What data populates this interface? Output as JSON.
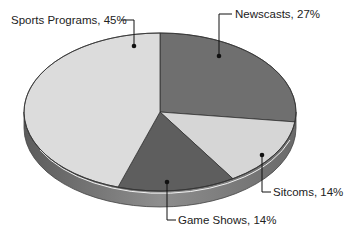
{
  "chart_data": {
    "type": "pie",
    "style": "3d-tilted",
    "title": "",
    "categories": [
      "Newscasts",
      "Sitcoms",
      "Game Shows",
      "Sports Programs"
    ],
    "values": [
      27,
      14,
      14,
      45
    ],
    "unit": "%",
    "start_angle_deg": 0,
    "direction": "clockwise",
    "legend": "none (leader-line labels)",
    "labels": [
      {
        "category": "Newscasts",
        "text": "Newscasts, 27%"
      },
      {
        "category": "Sitcoms",
        "text": "Sitcoms, 14%"
      },
      {
        "category": "Game Shows",
        "text": "Game Shows, 14%"
      },
      {
        "category": "Sports Programs",
        "text": "Sports Programs, 45%"
      }
    ],
    "colors": {
      "Newscasts": "#6f6f6f",
      "Sitcoms": "#d6d6d6",
      "Game Shows": "#5e5e5e",
      "Sports Programs": "#dcdcdc",
      "side": "#8a8a8a"
    }
  },
  "labels": {
    "newscasts": "Newscasts, 27%",
    "sitcoms": "Sitcoms, 14%",
    "game_shows": "Game Shows, 14%",
    "sports": "Sports Programs, 45%"
  }
}
